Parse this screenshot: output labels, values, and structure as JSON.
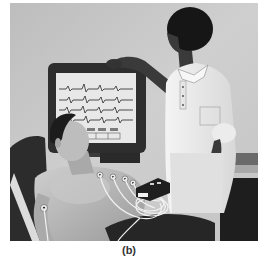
{
  "figure": {
    "caption": "(b)",
    "illustration": {
      "subject": "ECG examination illustration",
      "elements": [
        "patient-reclining",
        "nurse-standing",
        "ecg-monitor",
        "electrode-leads",
        "ecg-device"
      ],
      "monitor": {
        "trace_rows": 4
      }
    },
    "colors": {
      "background_wall": "#c9c9c9",
      "monitor_frame": "#2e2e2e",
      "monitor_screen": "#e8e8e8",
      "nurse_skin": "#3a3a3a",
      "uniform": "#efefef",
      "patient_skin": "#b5b5b5",
      "caption_text": "#333333"
    }
  }
}
